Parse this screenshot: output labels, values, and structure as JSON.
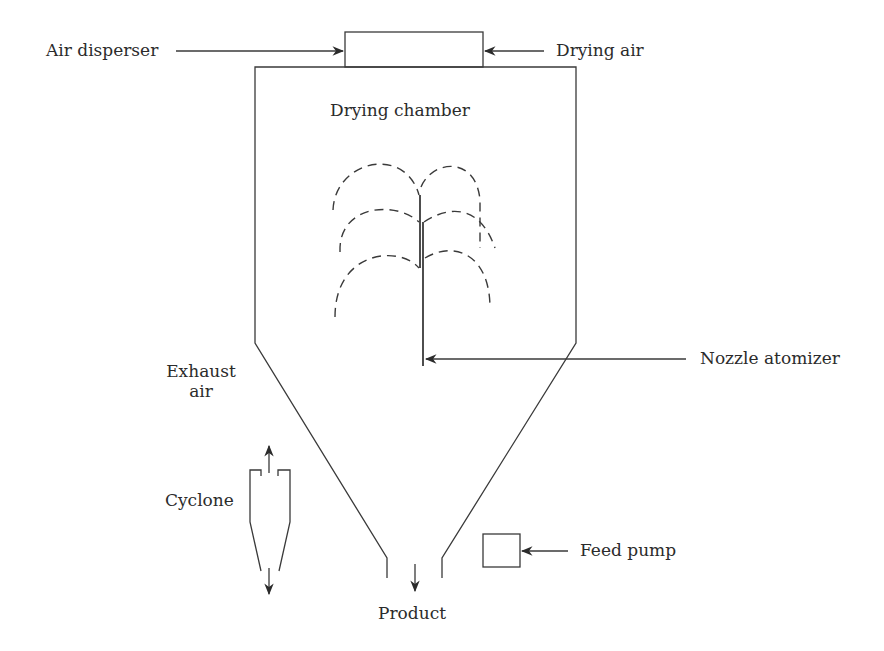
{
  "diagram": {
    "type": "spray-dryer-schematic",
    "colors": {
      "line": "#3a3a3a",
      "text": "#2b2b2b",
      "background": "#ffffff"
    },
    "labels": {
      "air_disperser": "Air disperser",
      "drying_air": "Drying air",
      "drying_chamber": "Drying chamber",
      "nozzle_atomizer": "Nozzle atomizer",
      "exhaust_air_line1": "Exhaust",
      "exhaust_air_line2": "air",
      "cyclone": "Cyclone",
      "feed_pump": "Feed pump",
      "product": "Product"
    },
    "components": [
      "air-disperser-box",
      "drying-chamber",
      "conical-bottom",
      "nozzle-atomizer",
      "spray-pattern",
      "cyclone",
      "feed-pump-box",
      "product-outlet"
    ]
  }
}
